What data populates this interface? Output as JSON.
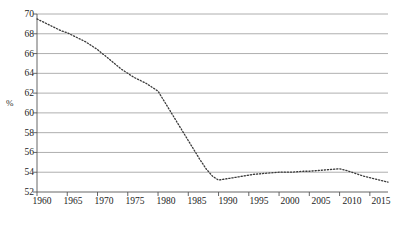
{
  "chart_data": {
    "type": "line",
    "title": "",
    "subtitle": "",
    "xlabel": "",
    "ylabel": "%",
    "ylim": [
      52,
      70
    ],
    "xlim": [
      1960,
      2018
    ],
    "grid": true,
    "legend": false,
    "line_style": "dotted",
    "line_color": "#3a3a3a",
    "grid_color": "#9a9a9a",
    "axis_color": "#555555",
    "background_color": "#ffffff",
    "ytick_labels": [
      "70",
      "68",
      "66",
      "64",
      "62",
      "60",
      "58",
      "56",
      "54",
      "52"
    ],
    "ytick_values": [
      70,
      68,
      66,
      64,
      62,
      60,
      58,
      56,
      54,
      52
    ],
    "xtick_labels": [
      "1960",
      "1965",
      "1970",
      "1975",
      "1980",
      "1985",
      "1990",
      "1995",
      "2000",
      "2005",
      "2010",
      "2015"
    ],
    "xtick_values": [
      1960,
      1965,
      1970,
      1975,
      1980,
      1985,
      1990,
      1995,
      2000,
      2005,
      2010,
      2015
    ],
    "x": [
      1960,
      1961,
      1962,
      1963,
      1964,
      1965,
      1966,
      1967,
      1968,
      1969,
      1970,
      1971,
      1972,
      1973,
      1974,
      1975,
      1976,
      1977,
      1978,
      1979,
      1980,
      1981,
      1982,
      1983,
      1984,
      1985,
      1986,
      1987,
      1988,
      1989,
      1990,
      1991,
      1992,
      1993,
      1994,
      1995,
      1996,
      1997,
      1998,
      1999,
      2000,
      2001,
      2002,
      2003,
      2004,
      2005,
      2006,
      2007,
      2008,
      2009,
      2010,
      2011,
      2012,
      2013,
      2014,
      2015,
      2016,
      2017,
      2018
    ],
    "values": [
      69.5,
      69.2,
      68.9,
      68.6,
      68.3,
      68.1,
      67.8,
      67.5,
      67.2,
      66.8,
      66.4,
      65.9,
      65.4,
      64.9,
      64.4,
      64.0,
      63.6,
      63.3,
      63.0,
      62.6,
      62.2,
      61.2,
      60.2,
      59.2,
      58.2,
      57.2,
      56.2,
      55.2,
      54.3,
      53.6,
      53.2,
      53.3,
      53.4,
      53.5,
      53.6,
      53.7,
      53.8,
      53.85,
      53.9,
      53.95,
      54.0,
      54.0,
      54.0,
      54.05,
      54.1,
      54.1,
      54.15,
      54.2,
      54.25,
      54.3,
      54.35,
      54.2,
      54.0,
      53.8,
      53.6,
      53.45,
      53.3,
      53.15,
      53.0
    ],
    "series": [
      {
        "name": "percent",
        "values": [
          69.5,
          69.2,
          68.9,
          68.6,
          68.3,
          68.1,
          67.8,
          67.5,
          67.2,
          66.8,
          66.4,
          65.9,
          65.4,
          64.9,
          64.4,
          64.0,
          63.6,
          63.3,
          63.0,
          62.6,
          62.2,
          61.2,
          60.2,
          59.2,
          58.2,
          57.2,
          56.2,
          55.2,
          54.3,
          53.6,
          53.2,
          53.3,
          53.4,
          53.5,
          53.6,
          53.7,
          53.8,
          53.85,
          53.9,
          53.95,
          54.0,
          54.0,
          54.0,
          54.05,
          54.1,
          54.1,
          54.15,
          54.2,
          54.25,
          54.3,
          54.35,
          54.2,
          54.0,
          53.8,
          53.6,
          53.45,
          53.3,
          53.15,
          53.0
        ]
      }
    ],
    "annotations": []
  },
  "plot": {
    "left_px": 37,
    "right_px": 388,
    "top_px": 14,
    "bottom_px": 192,
    "x_origin_year": 1960,
    "x_px_per_year": 6.2
  }
}
